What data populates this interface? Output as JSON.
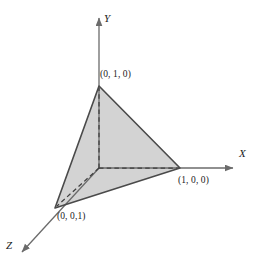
{
  "figure": {
    "type": "diagram",
    "background_color": "#ffffff",
    "axes": {
      "x": {
        "label": "X",
        "arrow": true,
        "style": "solid",
        "color": "#6b6b6b"
      },
      "y": {
        "label": "Y",
        "arrow": true,
        "style": "solid",
        "color": "#6b6b6b"
      },
      "z": {
        "label": "Z",
        "arrow": true,
        "style": "solid",
        "color": "#6b6b6b"
      }
    },
    "origin_label": "",
    "triangle": {
      "fill_color": "#d3d3d3",
      "edge_color": "#4a4a4a",
      "hidden_edge_style": "dashed",
      "vertices": [
        {
          "name": "vertex-y",
          "label": "(0, 1, 0)"
        },
        {
          "name": "vertex-x",
          "label": "(1, 0, 0)"
        },
        {
          "name": "vertex-z",
          "label": "(0, 0,1)"
        }
      ]
    },
    "hidden_lines": [
      {
        "name": "origin-to-y",
        "style": "dashed"
      },
      {
        "name": "origin-to-x",
        "style": "dashed"
      },
      {
        "name": "origin-to-z",
        "style": "dashed"
      }
    ]
  }
}
